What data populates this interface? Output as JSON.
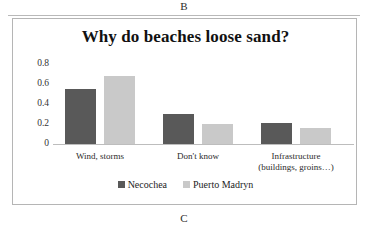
{
  "figure": {
    "panel_letter_top": "B",
    "panel_letter_bottom": "C"
  },
  "chart_data": {
    "type": "bar",
    "title": "Why do beaches loose sand?",
    "xlabel": "",
    "ylabel": "",
    "ylim": [
      0,
      0.8
    ],
    "yticks": [
      "0.8",
      "0.6",
      "0.4",
      "0.2",
      "0"
    ],
    "grid": false,
    "legend_position": "bottom",
    "categories": [
      "Wind, storms",
      "Don't know",
      "Infrastructure (buildings, groins…)"
    ],
    "category_lines": [
      [
        "Wind, storms"
      ],
      [
        "Don't know"
      ],
      [
        "Infrastructure",
        "(buildings, groins…)"
      ]
    ],
    "series": [
      {
        "name": "Necochea",
        "color": "#595959",
        "values": [
          0.55,
          0.3,
          0.21
        ]
      },
      {
        "name": "Puerto Madryn",
        "color": "#c9c9c9",
        "values": [
          0.68,
          0.2,
          0.16
        ]
      }
    ]
  }
}
